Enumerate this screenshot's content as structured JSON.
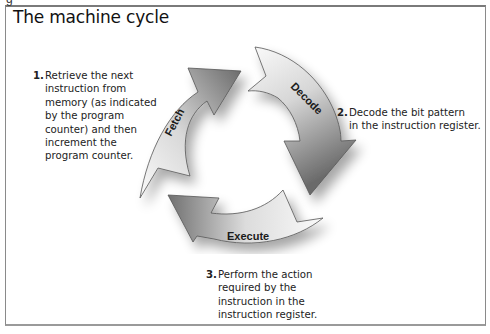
{
  "figure": {
    "title": "The machine cycle",
    "cropped_caption_fragment": "g"
  },
  "arrows": [
    {
      "id": "fetch",
      "label": "Fetch"
    },
    {
      "id": "decode",
      "label": "Decode"
    },
    {
      "id": "execute",
      "label": "Execute"
    }
  ],
  "steps": [
    {
      "number": "1.",
      "lines": [
        "Retrieve the next",
        "instruction from",
        "memory (as indicated",
        "by the program",
        "counter) and then",
        "increment the",
        "program counter."
      ]
    },
    {
      "number": "2.",
      "lines": [
        "Decode the bit pattern",
        "in the instruction register."
      ]
    },
    {
      "number": "3.",
      "lines": [
        "Perform the action",
        "required by the",
        "instruction in the",
        "instruction register."
      ]
    }
  ],
  "colors": {
    "arrow_light": "#f4f4f4",
    "arrow_dark": "#6e6e6e",
    "outline": "#555555",
    "frame": "#8a8a8a"
  }
}
